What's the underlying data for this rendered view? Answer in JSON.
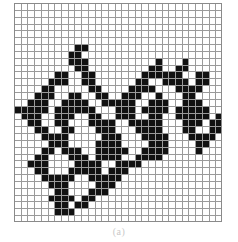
{
  "figure": {
    "caption": "(a)",
    "type": "binary-grid-raster",
    "grid": {
      "columns": 31,
      "rows": 32,
      "cell_size_px": 6.7,
      "line_color": "#9a9a9a",
      "fill_color": "#111111",
      "background_color": "#ffffff",
      "border_color": "#8a8a8a"
    },
    "cells": [
      "...............................",
      "...............................",
      "...............................",
      "...............................",
      "...............................",
      "...............................",
      ".........##....................",
      "........##.....................",
      "........###..........#...#.....",
      ".........##.........##..##.....",
      "......##..##.......######..##..",
      ".....###..##......##..####.##..",
      "....##.....##....####...####...",
      "...###..##..##..###..#...##....",
      "..###..####..#####..###..###...",
      "#####.######...###.####.#####..",
      ".###..###..##..###..##..#####.#",
      "..##..##...####..#####...###.##",
      "...##..##...###...####...##..##",
      "....####.....###...####...####.",
      ".....###....####....###....##..",
      "....##.###..#####..####....#...",
      "...##...###.####..####.........",
      "..###....####..####............",
      "...##...#####.###..............",
      "....#####..#####...............",
      ".....###....###................",
      "......##...###.................",
      ".....####.##...................",
      "......##.##....................",
      "......###......................",
      "..............................."
    ]
  }
}
